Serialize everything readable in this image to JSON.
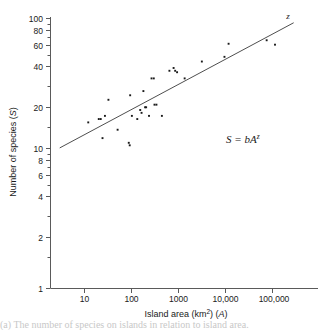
{
  "figure": {
    "equation_annotation": "S = bA",
    "equation_exponent": "z",
    "line_label": "z",
    "caption_fragment": "(a) The number of species on islands in relation to island area."
  },
  "axes": {
    "x": {
      "title_main": "Island area (km",
      "title_sup": "2",
      "title_mid": ") (",
      "title_var": "A",
      "title_end": ")",
      "ticks": [
        "10",
        "100",
        "1000",
        "10,000",
        "100,000"
      ],
      "tick_values": [
        10,
        100,
        1000,
        10000,
        100000
      ],
      "scale": "log",
      "range": [
        3,
        300000
      ]
    },
    "y": {
      "title_main": "Number of species (",
      "title_var": "S",
      "title_end": ")",
      "ticks": [
        "100",
        "80",
        "60",
        "40",
        "20",
        "10",
        "8",
        "6",
        "4",
        "2",
        "1"
      ],
      "tick_values": [
        100,
        80,
        60,
        40,
        20,
        10,
        8,
        6,
        4,
        2,
        1
      ],
      "scale": "log",
      "range": [
        1,
        100
      ]
    }
  },
  "chart_data": {
    "type": "scatter",
    "title": "",
    "xlabel": "Island area (km2) (A)",
    "ylabel": "Number of species (S)",
    "xscale": "log",
    "yscale": "log",
    "xlim": [
      3,
      300000
    ],
    "ylim": [
      1,
      100
    ],
    "grid": false,
    "legend": "none",
    "annotations": [
      {
        "text": "S = bA^z",
        "x": 12000,
        "y": 14
      },
      {
        "text": "z",
        "x": 130000,
        "y": 97
      }
    ],
    "series": [
      {
        "name": "Islands",
        "marker": "square",
        "points": [
          {
            "x": 12,
            "y": 17
          },
          {
            "x": 20,
            "y": 18
          },
          {
            "x": 22,
            "y": 18
          },
          {
            "x": 24,
            "y": 13
          },
          {
            "x": 27,
            "y": 19
          },
          {
            "x": 32,
            "y": 25
          },
          {
            "x": 50,
            "y": 15
          },
          {
            "x": 86,
            "y": 12
          },
          {
            "x": 90,
            "y": 11.5
          },
          {
            "x": 92,
            "y": 27
          },
          {
            "x": 100,
            "y": 19
          },
          {
            "x": 130,
            "y": 18
          },
          {
            "x": 150,
            "y": 21
          },
          {
            "x": 160,
            "y": 20
          },
          {
            "x": 175,
            "y": 29
          },
          {
            "x": 190,
            "y": 22
          },
          {
            "x": 200,
            "y": 22
          },
          {
            "x": 230,
            "y": 19
          },
          {
            "x": 260,
            "y": 36
          },
          {
            "x": 290,
            "y": 36
          },
          {
            "x": 300,
            "y": 23
          },
          {
            "x": 330,
            "y": 23
          },
          {
            "x": 430,
            "y": 19
          },
          {
            "x": 620,
            "y": 41
          },
          {
            "x": 760,
            "y": 43
          },
          {
            "x": 820,
            "y": 41
          },
          {
            "x": 900,
            "y": 40
          },
          {
            "x": 1300,
            "y": 36
          },
          {
            "x": 3000,
            "y": 48
          },
          {
            "x": 9000,
            "y": 52
          },
          {
            "x": 11000,
            "y": 65
          },
          {
            "x": 70000,
            "y": 69
          },
          {
            "x": 105000,
            "y": 64
          }
        ]
      }
    ],
    "fit_line": {
      "name": "Species-area regression",
      "equation": "S = bA^z",
      "x_start": 3,
      "y_start": 11,
      "x_end": 260000,
      "y_end": 93
    }
  }
}
